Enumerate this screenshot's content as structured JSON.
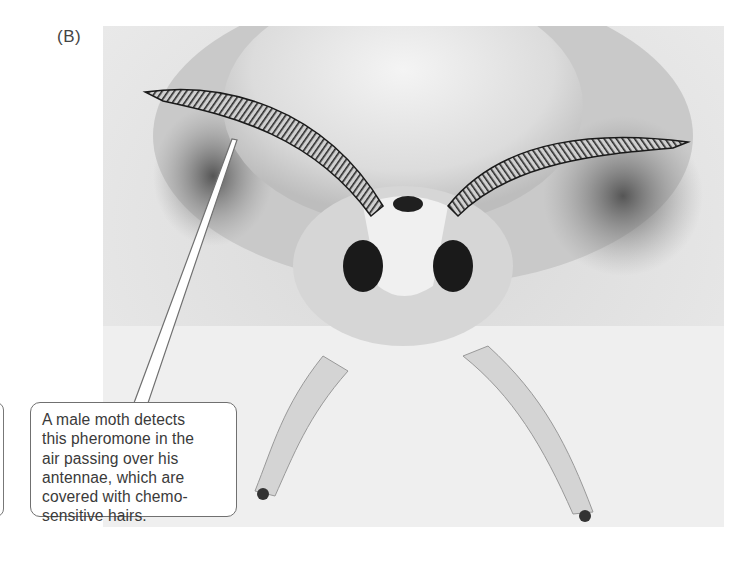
{
  "figure": {
    "panel_label": "(B)",
    "photo": {
      "subject": "male silk moth with feathery antennae, front view",
      "style": "grayscale photograph"
    },
    "callout": {
      "text": "A male moth detects\nthis pheromone in the\nair passing over his\nantennae, which are\ncovered with chemo-\nsensitive hairs.",
      "points_to": "left antenna"
    }
  },
  "colors": {
    "background": "#ffffff",
    "callout_border": "#707070",
    "text": "#3a3a3a"
  }
}
